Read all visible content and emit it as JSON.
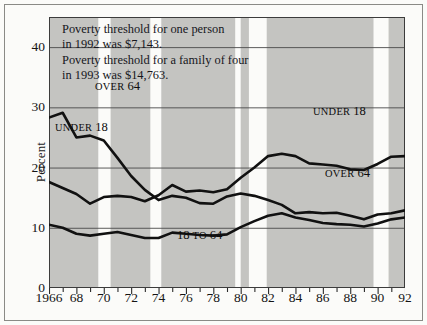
{
  "figure": {
    "background": "#fbfbf9",
    "plot_background": "#c4c4c1",
    "band_color": "#fbfbf9",
    "line_color": "#111111",
    "grid_color": "#4a4a4a"
  },
  "annotation": {
    "text": "Poverty threshold for one person\nin 1992 was $7,143.\nPoverty threshold for a family of four\nin 1993 was $14,763."
  },
  "labels": {
    "over64_left": {
      "small": "OVER",
      "big": "64"
    },
    "under18_left": {
      "small": "UNDER",
      "big": "18"
    },
    "under18_right": {
      "small": "UNDER",
      "big": "18"
    },
    "over64_right": {
      "small": "OVER",
      "big": "64"
    },
    "mid_adults": {
      "big1": "18",
      "small": "TO",
      "big2": "64"
    }
  },
  "chart_data": {
    "type": "line",
    "title": "",
    "xlabel": "",
    "ylabel": "Percent",
    "xlim": [
      1966,
      1992
    ],
    "ylim": [
      0,
      45
    ],
    "yticks": [
      0,
      10,
      20,
      30,
      40
    ],
    "ytick_labels": [
      "0",
      "10",
      "20",
      "30",
      "40"
    ],
    "gridlines_at": [
      10,
      20,
      30,
      40
    ],
    "grid": true,
    "legend": "inline-annotations",
    "xticks": [
      1966,
      1968,
      1970,
      1972,
      1974,
      1976,
      1978,
      1980,
      1982,
      1984,
      1986,
      1988,
      1990,
      1992
    ],
    "xtick_labels": [
      "1966",
      "68",
      "70",
      "72",
      "74",
      "76",
      "78",
      "80",
      "82",
      "84",
      "86",
      "88",
      "90",
      "92"
    ],
    "minor_xticks_every": 1,
    "x": [
      1966,
      1967,
      1968,
      1969,
      1970,
      1971,
      1972,
      1973,
      1974,
      1975,
      1976,
      1977,
      1978,
      1979,
      1980,
      1981,
      1982,
      1983,
      1984,
      1985,
      1986,
      1987,
      1988,
      1989,
      1990,
      1991,
      1992
    ],
    "series": [
      {
        "name": "OVER 64",
        "values": [
          28.3,
          29.1,
          25.0,
          25.3,
          24.5,
          21.6,
          18.6,
          16.3,
          14.6,
          15.3,
          15.0,
          14.1,
          14.0,
          15.2,
          15.7,
          15.3,
          14.6,
          13.8,
          12.4,
          12.6,
          12.4,
          12.5,
          12.0,
          11.4,
          12.2,
          12.4,
          12.9
        ]
      },
      {
        "name": "UNDER 18",
        "values": [
          17.6,
          16.6,
          15.6,
          14.0,
          15.1,
          15.3,
          15.1,
          14.4,
          15.4,
          17.1,
          16.0,
          16.2,
          15.9,
          16.4,
          18.3,
          20.0,
          21.9,
          22.3,
          21.9,
          20.7,
          20.5,
          20.3,
          19.7,
          19.6,
          20.6,
          21.8,
          21.9
        ]
      },
      {
        "name": "18 TO 64",
        "values": [
          10.5,
          10.0,
          9.0,
          8.7,
          9.0,
          9.3,
          8.8,
          8.3,
          8.3,
          9.2,
          9.0,
          8.8,
          8.7,
          8.9,
          10.1,
          11.1,
          12.0,
          12.4,
          11.7,
          11.3,
          10.8,
          10.6,
          10.5,
          10.2,
          10.7,
          11.4,
          11.7
        ]
      }
    ],
    "shaded_bands": [
      {
        "start": 1969.6,
        "end": 1970.5
      },
      {
        "start": 1973.4,
        "end": 1974.2
      },
      {
        "start": 1979.6,
        "end": 1980.0
      },
      {
        "start": 1980.6,
        "end": 1981.9
      },
      {
        "start": 1989.7,
        "end": 1990.8
      }
    ]
  }
}
